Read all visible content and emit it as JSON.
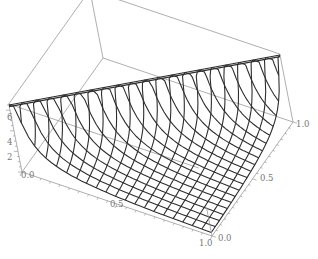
{
  "chart_data": {
    "type": "surface3d",
    "title": "",
    "xlabel": "",
    "ylabel": "",
    "zlabel": "",
    "x_range": [
      0.0,
      1.0
    ],
    "y_range": [
      0.0,
      1.0
    ],
    "z_range": [
      0.0,
      6.6
    ],
    "x_ticks": [
      "0.0",
      "0.5",
      "1.0"
    ],
    "y_ticks": [
      "0.0",
      "0.5",
      "1.0"
    ],
    "z_ticks": [
      "2",
      "4",
      "6"
    ],
    "z_origin_label": "0.0",
    "mesh_divisions": 20,
    "surface_description": "Surface rising sharply toward the diagonal x = y, forming a ridge at the top of the box; mesh descends toward the corner x = 1, y = 0.",
    "grid": false,
    "legend": null,
    "colors": {
      "mesh": "#2e2e2e",
      "box": "#9a9a9a",
      "labels": "#777777",
      "background": "#ffffff"
    }
  },
  "axes": {
    "x_labels": [
      {
        "text": "0.0",
        "pos": [
          21,
          178
        ]
      },
      {
        "text": "0.5",
        "pos": [
          110,
          207
        ]
      },
      {
        "text": "1.0",
        "pos": [
          199,
          246
        ]
      }
    ],
    "y_labels": [
      {
        "text": "0.0",
        "pos": [
          218,
          241
        ]
      },
      {
        "text": "0.5",
        "pos": [
          260,
          181
        ]
      },
      {
        "text": "1.0",
        "pos": [
          296,
          127
        ]
      }
    ],
    "z_labels": [
      {
        "text": "2",
        "pos": [
          7,
          160
        ]
      },
      {
        "text": "4",
        "pos": [
          7,
          145
        ]
      },
      {
        "text": "6",
        "pos": [
          7,
          120
        ]
      }
    ]
  }
}
